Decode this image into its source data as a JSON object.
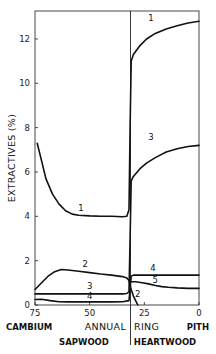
{
  "chart_data": {
    "type": "line",
    "title": "",
    "xlabel_left": "CAMBIUM",
    "xlabel_center": "ANNUAL",
    "xlabel_center2": "RING",
    "xlabel_right": "PITH",
    "ylabel": "EXTRACTIVES (%)",
    "xlim": [
      75,
      0
    ],
    "ylim": [
      0,
      13.2
    ],
    "x_ticks": [
      75,
      50,
      25,
      0
    ],
    "y_ticks": [
      0,
      2,
      4,
      6,
      8,
      10,
      12
    ],
    "grid": false,
    "boundary": {
      "ring": 31,
      "left_region": "SAPWOOD",
      "right_region": "HEARTWOOD"
    },
    "series": [
      {
        "name": "1",
        "x": [
          74,
          72,
          70,
          67,
          64,
          61,
          58,
          55,
          50,
          45,
          40,
          35,
          33,
          32,
          31.5,
          31,
          30,
          27,
          24,
          20,
          15,
          10,
          5,
          0
        ],
        "y": [
          7.3,
          6.5,
          5.7,
          5.0,
          4.55,
          4.25,
          4.1,
          4.05,
          4.02,
          4.0,
          4.0,
          3.98,
          4.0,
          4.3,
          8.0,
          11.0,
          11.3,
          11.7,
          12.0,
          12.25,
          12.45,
          12.6,
          12.72,
          12.8
        ]
      },
      {
        "name": "2",
        "x": [
          75,
          72,
          69,
          66,
          63,
          60,
          55,
          50,
          45,
          40,
          35,
          33,
          32,
          31,
          30,
          29,
          28
        ],
        "y": [
          0.7,
          1.0,
          1.3,
          1.5,
          1.6,
          1.58,
          1.52,
          1.46,
          1.4,
          1.35,
          1.28,
          1.22,
          1.1,
          0.7,
          0.4,
          0.2,
          0.0
        ]
      },
      {
        "name": "3",
        "x": [
          75,
          65,
          55,
          45,
          35,
          33,
          32,
          31.5,
          31,
          30,
          27,
          24,
          20,
          15,
          10,
          5,
          0
        ],
        "y": [
          0.5,
          0.5,
          0.5,
          0.5,
          0.5,
          0.52,
          0.6,
          3.0,
          5.6,
          5.8,
          6.15,
          6.4,
          6.65,
          6.9,
          7.05,
          7.15,
          7.2
        ]
      },
      {
        "name": "4",
        "x": [
          75,
          72,
          68,
          64,
          60,
          55,
          50,
          45,
          40,
          35,
          32,
          31,
          30,
          25,
          20,
          15,
          10,
          5,
          0
        ],
        "y": [
          0.25,
          0.26,
          0.2,
          0.15,
          0.14,
          0.14,
          0.14,
          0.14,
          0.14,
          0.15,
          0.2,
          1.3,
          1.35,
          1.35,
          1.35,
          1.35,
          1.35,
          1.35,
          1.35
        ]
      },
      {
        "name": "5",
        "x": [
          31,
          29,
          26,
          23,
          20,
          17,
          14,
          10,
          5,
          0
        ],
        "y": [
          1.05,
          1.05,
          1.0,
          0.95,
          0.88,
          0.83,
          0.8,
          0.77,
          0.75,
          0.75
        ]
      }
    ],
    "curve_labels": [
      {
        "text": "1",
        "x": 22,
        "y": 12.8
      },
      {
        "text": "1",
        "x": 54,
        "y": 4.25
      },
      {
        "text": "3",
        "x": 22,
        "y": 7.45
      },
      {
        "text": "2",
        "x": 52,
        "y": 1.7
      },
      {
        "text": "3",
        "x": 50,
        "y": 0.72
      },
      {
        "text": "4",
        "x": 50,
        "y": 0.28
      },
      {
        "text": "4",
        "x": 21,
        "y": 1.55
      },
      {
        "text": "5",
        "x": 20,
        "y": 1.0
      },
      {
        "text": "2",
        "x": 28,
        "y": 0.35
      }
    ]
  },
  "labels": {
    "y_axis": "EXTRACTIVES (%)",
    "x_cambium": "CAMBIUM",
    "x_annual": "ANNUAL",
    "x_ring": "RING",
    "x_pith": "PITH",
    "sapwood": "SAPWOOD",
    "heartwood": "HEARTWOOD",
    "x_ticks": [
      "75",
      "50",
      "25",
      "0"
    ],
    "y_ticks": [
      "0",
      "2",
      "4",
      "6",
      "8",
      "10",
      "12"
    ]
  }
}
